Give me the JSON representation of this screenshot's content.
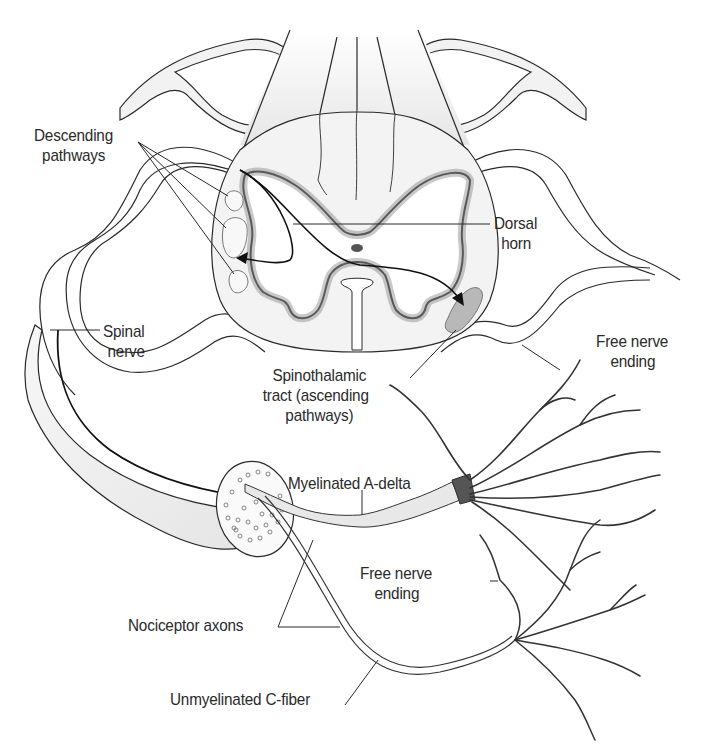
{
  "diagram": {
    "colors": {
      "line": "#2a2a2a",
      "gray_matter_edge": "#555555",
      "white_matter": "#f4f4f4",
      "nerve_fill": "#f0f0f0",
      "tract_fill": "#b8b8b8",
      "background": "#ffffff"
    },
    "labels": {
      "descending": {
        "line1": "Descending",
        "line2": "pathways"
      },
      "dorsal_horn": {
        "line1": "Dorsal",
        "line2": "horn"
      },
      "spinal_nerve": {
        "line1": "Spinal",
        "line2": "nerve"
      },
      "spinothalamic": {
        "line1": "Spinothalamic",
        "line2": "tract (ascending",
        "line3": "pathways)"
      },
      "free_nerve_top": {
        "line1": "Free nerve",
        "line2": "ending"
      },
      "myelinated": {
        "text": "Myelinated A-delta"
      },
      "free_nerve_bottom": {
        "line1": "Free nerve",
        "line2": "ending"
      },
      "nociceptor": {
        "text": "Nociceptor axons"
      },
      "unmyelinated": {
        "text": "Unmyelinated C-fiber"
      }
    }
  }
}
